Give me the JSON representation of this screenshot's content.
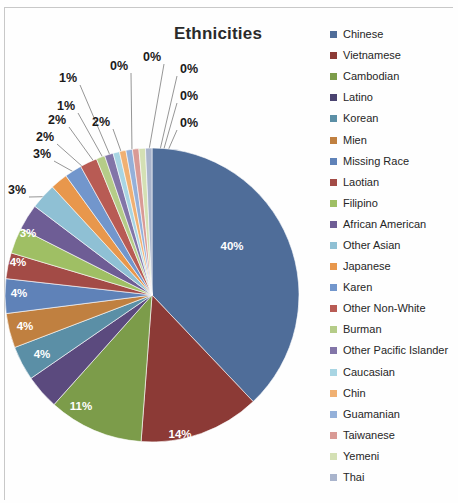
{
  "chart_data": {
    "type": "pie",
    "title": "Ethnicities",
    "xlabel": "",
    "ylabel": "",
    "legend_position": "right",
    "grid": false,
    "categories": [
      "Chinese",
      "Vietnamese",
      "Cambodian",
      "Latino",
      "Korean",
      "Mien",
      "Missing Race",
      "Laotian",
      "Filipino",
      "African American",
      "Other Asian",
      "Japanese",
      "Karen",
      "Other Non-White",
      "Burman",
      "Other Pacific Islander",
      "Caucasian",
      "Chin",
      "Guamanian",
      "Taiwanese",
      "Yemeni",
      "Thai"
    ],
    "values": [
      40,
      14,
      11,
      4,
      4,
      4,
      4,
      3,
      3,
      3,
      3,
      2,
      2,
      2,
      1,
      1,
      0,
      0,
      0,
      0,
      0,
      0
    ],
    "labels": [
      "40%",
      "14%",
      "11%",
      "4%",
      "4%",
      "4%",
      "4%",
      "3%",
      "3%",
      "3%",
      "3%",
      "2%",
      "2%",
      "2%",
      "1%",
      "1%",
      "0%",
      "0%",
      "0%",
      "0%",
      "0%",
      "0%"
    ],
    "colors": [
      "#4f6д99",
      "#8c3a36",
      "#7c9c4a",
      "#5b4a7e",
      "#5b8fa6",
      "#c08040",
      "#5f82b8",
      "#a34b46",
      "#9fbf64",
      "#6e5d95",
      "#8fc0d4",
      "#e8974c",
      "#7296cc",
      "#b85b54",
      "#b5cc88",
      "#8275a8",
      "#a8d5e3",
      "#f0b072",
      "#94b0d9",
      "#d99a95",
      "#d4e0b4",
      "#a9b4cc"
    ]
  },
  "legend": {
    "items": [
      {
        "label": "Chinese",
        "color": "#4f6d99"
      },
      {
        "label": "Vietnamese",
        "color": "#8c3a36"
      },
      {
        "label": "Cambodian",
        "color": "#7c9c4a"
      },
      {
        "label": "Latino",
        "color": "#4a4370"
      },
      {
        "label": "Korean",
        "color": "#5b8fa6"
      },
      {
        "label": "Mien",
        "color": "#c08040"
      },
      {
        "label": "Missing Race",
        "color": "#5f82b8"
      },
      {
        "label": "Laotian",
        "color": "#a34b46"
      },
      {
        "label": "Filipino",
        "color": "#9fbf64"
      },
      {
        "label": "African American",
        "color": "#6e5d95"
      },
      {
        "label": "Other Asian",
        "color": "#8fc0d4"
      },
      {
        "label": "Japanese",
        "color": "#e8974c"
      },
      {
        "label": "Karen",
        "color": "#7296cc"
      },
      {
        "label": "Other Non-White",
        "color": "#b85b54"
      },
      {
        "label": "Burman",
        "color": "#b5cc88"
      },
      {
        "label": "Other Pacific Islander",
        "color": "#8275a8"
      },
      {
        "label": "Caucasian",
        "color": "#a8d5e3"
      },
      {
        "label": "Chin",
        "color": "#f0b072"
      },
      {
        "label": "Guamanian",
        "color": "#94b0d9"
      },
      {
        "label": "Taiwanese",
        "color": "#d99a95"
      },
      {
        "label": "Yemeni",
        "color": "#d4e0b4"
      },
      {
        "label": "Thai",
        "color": "#a9b4cc"
      }
    ]
  },
  "outside_labels": [
    {
      "text": "1%",
      "x": 68,
      "y": 82
    },
    {
      "text": "0%",
      "x": 119,
      "y": 70
    },
    {
      "text": "0%",
      "x": 152,
      "y": 61
    },
    {
      "text": "0%",
      "x": 189,
      "y": 73
    },
    {
      "text": "0%",
      "x": 189,
      "y": 100
    },
    {
      "text": "0%",
      "x": 189,
      "y": 127
    },
    {
      "text": "1%",
      "x": 66,
      "y": 110
    },
    {
      "text": "2%",
      "x": 101,
      "y": 126
    },
    {
      "text": "2%",
      "x": 57,
      "y": 124
    },
    {
      "text": "2%",
      "x": 45,
      "y": 141
    },
    {
      "text": "3%",
      "x": 42,
      "y": 158
    },
    {
      "text": "3%",
      "x": 17,
      "y": 194
    }
  ],
  "inside_labels": [
    {
      "text": "40%",
      "x": 232,
      "y": 250
    },
    {
      "text": "14%",
      "x": 180,
      "y": 438
    },
    {
      "text": "11%",
      "x": 81,
      "y": 410
    },
    {
      "text": "4%",
      "x": 42,
      "y": 358
    },
    {
      "text": "4%",
      "x": 25,
      "y": 330
    },
    {
      "text": "4%",
      "x": 19,
      "y": 297
    },
    {
      "text": "4%",
      "x": 18,
      "y": 266
    },
    {
      "text": "3%",
      "x": 28,
      "y": 237
    }
  ]
}
